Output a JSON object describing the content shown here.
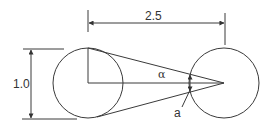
{
  "diagram": {
    "labels": {
      "distance": "2.5",
      "diameter": "1.0",
      "angle": "α",
      "gap": "a"
    },
    "colors": {
      "stroke": "#3a3a3a",
      "text": "#333333",
      "background": "#ffffff"
    },
    "shapes": {
      "left_circle": {
        "cx": 88,
        "cy": 83,
        "r": 35
      },
      "right_circle": {
        "cx": 224,
        "cy": 83,
        "r": 35
      }
    }
  }
}
